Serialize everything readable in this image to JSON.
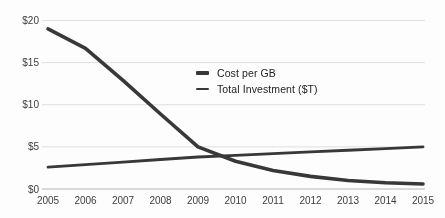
{
  "chart_data": {
    "type": "line",
    "title": "",
    "xlabel": "",
    "ylabel": "",
    "x": [
      2005,
      2006,
      2007,
      2008,
      2009,
      2010,
      2011,
      2012,
      2013,
      2014,
      2015
    ],
    "series": [
      {
        "name": "Cost per GB",
        "values": [
          19.0,
          16.7,
          12.9,
          8.9,
          5.0,
          3.3,
          2.2,
          1.5,
          1.0,
          0.75,
          0.6
        ],
        "stroke_width": 3.6
      },
      {
        "name": "Total Investment ($T)",
        "values": [
          2.6,
          2.9,
          3.2,
          3.5,
          3.8,
          4.0,
          4.2,
          4.4,
          4.6,
          4.8,
          5.0
        ],
        "stroke_width": 2.8
      }
    ],
    "ytick_values": [
      0,
      5,
      10,
      15,
      20
    ],
    "ytick_labels": [
      "$0",
      "$5",
      "$10",
      "$15",
      "$20"
    ],
    "ylim": [
      0,
      20
    ],
    "grid": "horizontal-light",
    "legend_position": "center"
  },
  "colors": {
    "line": "#383838",
    "grid": "#dedede",
    "axis": "#b5b5b5",
    "tick_text": "#3d3d3d",
    "legend_text": "#222222",
    "background": "#fdfdfd"
  }
}
